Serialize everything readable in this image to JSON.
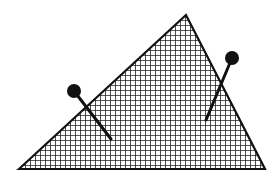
{
  "diagram": {
    "width": 280,
    "height": 179,
    "background": "#ffffff",
    "stroke_color": "#111111",
    "triangle": {
      "shape": "triangle",
      "points": [
        [
          19,
          169
        ],
        [
          186,
          15
        ],
        [
          265,
          169
        ]
      ],
      "fill_pattern": "crosshatch-grid",
      "grid_pitch": 5
    },
    "pins": [
      {
        "name": "left-pin",
        "head": {
          "cx": 74,
          "cy": 91,
          "r": 7
        },
        "shaft_end": {
          "x": 111,
          "y": 139
        }
      },
      {
        "name": "right-pin",
        "head": {
          "cx": 232,
          "cy": 58,
          "r": 7
        },
        "shaft_end": {
          "x": 206,
          "y": 120
        }
      }
    ]
  }
}
